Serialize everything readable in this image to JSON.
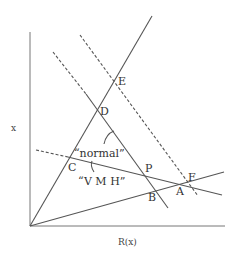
{
  "diagram": {
    "axes": {
      "y_label": "x",
      "x_label": "R(x)"
    },
    "points": {
      "A": "A",
      "B": "B",
      "C": "C",
      "D": "D",
      "E": "E",
      "F": "F",
      "P": "P"
    },
    "annotations": {
      "normal": "“normal”",
      "vmh": "“V M H”"
    }
  }
}
